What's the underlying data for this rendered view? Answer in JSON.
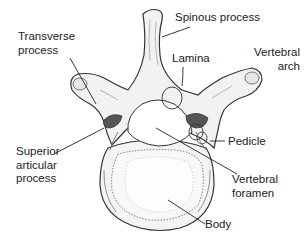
{
  "diagram": {
    "labels": [
      {
        "id": "spinous-process",
        "text": "Spinous process"
      },
      {
        "id": "transverse-process",
        "text": "Transverse\nprocess"
      },
      {
        "id": "lamina",
        "text": "Lamina"
      },
      {
        "id": "vertebral-arch",
        "text": "Vertebral\narch"
      },
      {
        "id": "pedicle",
        "text": "Pedicle"
      },
      {
        "id": "superior-articular-process",
        "text": "Superior\narticular\nprocess"
      },
      {
        "id": "vertebral-foramen",
        "text": "Vertebral\nforamen"
      },
      {
        "id": "body",
        "text": "Body"
      }
    ],
    "colors": {
      "outline": "#333333",
      "bone_fill": "#f2f2f0",
      "shading": "#9a9a9a",
      "articular_dark": "#555555",
      "text": "#222222"
    }
  }
}
